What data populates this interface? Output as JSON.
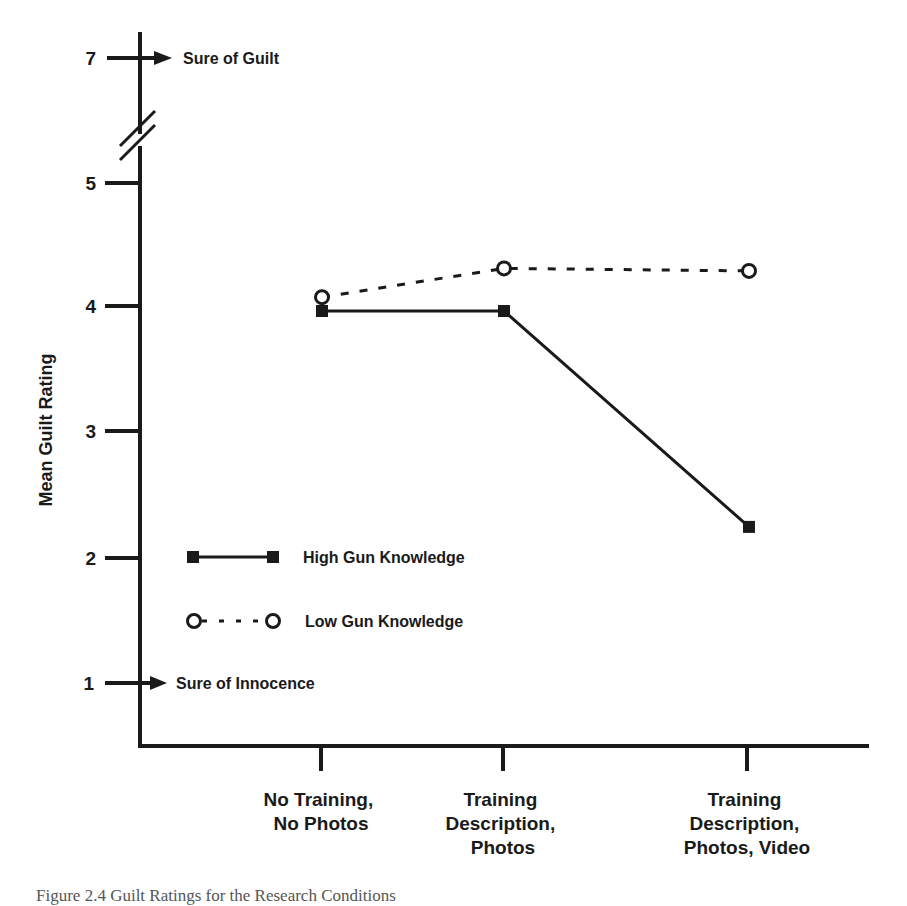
{
  "chart_data": {
    "type": "line",
    "title": "",
    "xlabel": "",
    "ylabel": "Mean Guilt Rating",
    "categories": [
      [
        "No Training,",
        "No Photos"
      ],
      [
        "Training",
        "Description,",
        "Photos"
      ],
      [
        "Training",
        "Description,",
        "Photos, Video"
      ]
    ],
    "series": [
      {
        "name": "High Gun Knowledge",
        "style": "solid",
        "marker": "filled-square",
        "values": [
          3.96,
          3.96,
          2.24
        ]
      },
      {
        "name": "Low Gun Knowledge",
        "style": "dashed",
        "marker": "open-circle",
        "values": [
          4.07,
          4.3,
          4.28
        ]
      }
    ],
    "yticks": [
      1,
      2,
      3,
      4,
      5,
      7
    ],
    "ylim": [
      1,
      7
    ],
    "axis_break": "between 5 and 7",
    "annotations": [
      {
        "y": 7,
        "text": "Sure of Guilt"
      },
      {
        "y": 1,
        "text": "Sure of Innocence"
      }
    ],
    "grid": false,
    "legend_position": "inside lower-left"
  },
  "ui": {
    "yticks": [
      "7",
      "5",
      "4",
      "3",
      "2",
      "1"
    ],
    "ylabel": "Mean Guilt Rating",
    "anno_top": "Sure of Guilt",
    "anno_bottom": "Sure of Innocence",
    "cat0": [
      "No Training,",
      "No Photos"
    ],
    "cat1": [
      "Training",
      "Description,",
      "Photos"
    ],
    "cat2": [
      "Training",
      "Description,",
      "Photos, Video"
    ],
    "legend_high": "High Gun Knowledge",
    "legend_low": "Low Gun Knowledge",
    "caption": "Figure 2.4   Guilt Ratings for the Research Conditions"
  }
}
